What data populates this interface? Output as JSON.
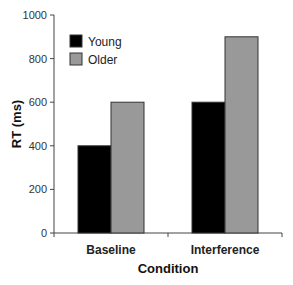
{
  "chart_data": {
    "type": "bar",
    "title": "",
    "xlabel": "Condition",
    "ylabel": "RT (ms)",
    "categories": [
      "Baseline",
      "Interference"
    ],
    "series": [
      {
        "name": "Young",
        "color": "#000000",
        "values": [
          400,
          600
        ]
      },
      {
        "name": "Older",
        "color": "#999999",
        "values": [
          600,
          900
        ]
      }
    ],
    "ylim": [
      0,
      1000
    ],
    "yticks": [
      0,
      200,
      400,
      600,
      800,
      1000
    ],
    "ytick_labels": [
      "0",
      "200",
      "400",
      "600",
      "800",
      "1000"
    ],
    "grid": false,
    "legend_position": "top-left"
  }
}
